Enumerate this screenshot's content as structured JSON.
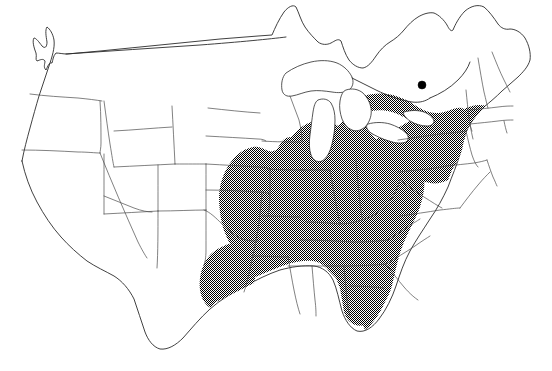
{
  "figure": {
    "kind": "distribution-map",
    "region": "Continental United States",
    "title": "",
    "caption": "",
    "background_color": "#ffffff",
    "outline_color": "#2b2b2b",
    "state_border_color": "#4a4a4a",
    "shading_color": "#000000",
    "shading_style": "stipple-hatch",
    "shading_density_percent": 50
  },
  "legend": {
    "visible": false,
    "entries": [
      {
        "label": "Shaded range",
        "swatch": "stipple-hatch"
      },
      {
        "label": "Isolated record",
        "swatch": "black-dot"
      }
    ]
  },
  "markers": [
    {
      "name": "isolated-record-point",
      "icon": "filled-circle-icon",
      "x": 422,
      "y": 85,
      "radius": 4,
      "color": "#000000",
      "label": ""
    }
  ],
  "shaded_states": [
    "Missouri",
    "Arkansas",
    "Louisiana",
    "East Texas",
    "Mississippi",
    "Alabama",
    "Georgia",
    "Florida",
    "South Carolina",
    "North Carolina",
    "Tennessee",
    "Kentucky",
    "Virginia",
    "West Virginia",
    "Ohio",
    "Indiana",
    "Illinois",
    "Maryland",
    "Delaware",
    "New Jersey",
    "Pennsylvania",
    "Southern New York",
    "Connecticut",
    "Rhode Island",
    "Massachusetts"
  ],
  "unshaded_states": [
    "Washington",
    "Oregon",
    "California",
    "Idaho",
    "Nevada",
    "Utah",
    "Arizona",
    "Montana",
    "Wyoming",
    "Colorado",
    "New Mexico",
    "North Dakota",
    "South Dakota",
    "Nebraska",
    "Kansas",
    "Oklahoma",
    "West Texas",
    "Minnesota",
    "Iowa",
    "Wisconsin",
    "Michigan",
    "Maine",
    "New Hampshire",
    "Vermont",
    "Northern New York"
  ],
  "water_bodies": [
    "Lake Superior",
    "Lake Michigan",
    "Lake Huron",
    "Lake Erie",
    "Lake Ontario"
  ],
  "axes": {
    "visible": false
  },
  "scale_bar": {
    "visible": false
  },
  "north_arrow": {
    "visible": false
  }
}
